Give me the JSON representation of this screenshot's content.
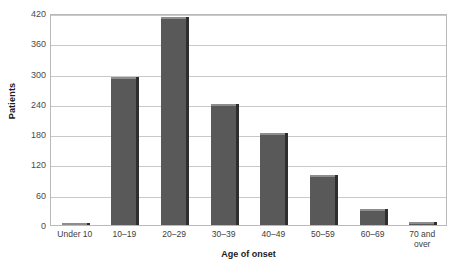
{
  "chart_data": {
    "type": "bar",
    "title": "",
    "xlabel": "Age of onset",
    "ylabel": "Patients",
    "categories": [
      "Under 10",
      "10–19",
      "20–29",
      "30–39",
      "40–49",
      "50–59",
      "60–69",
      "70 and\nover"
    ],
    "values": [
      3,
      294,
      413,
      239,
      183,
      99,
      31,
      5
    ],
    "ylim": [
      0,
      420
    ],
    "yticks": [
      0,
      60,
      120,
      180,
      240,
      300,
      360,
      420
    ],
    "ytick_labels": [
      "0",
      "60",
      "120",
      "180",
      "240",
      "300",
      "360",
      "420"
    ],
    "grid": true,
    "legend": "none",
    "colors": {
      "bar_fill": "#595959",
      "bar_shadow": "#2e2e2e",
      "bar_cap": "#8d8d8d",
      "gridline": "#c9c9c9",
      "frame": "#b9b9b9",
      "background": "#ffffff",
      "axis_title_text": "#1b1b1b",
      "tick_text": "#4a4a4a"
    }
  }
}
